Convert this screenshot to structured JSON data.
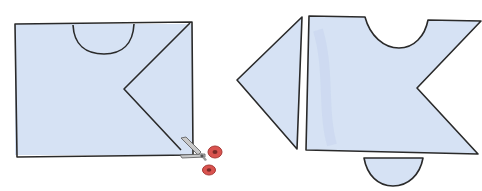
{
  "figure": {
    "description": "Paper cutting illustration: a folded rectangle with a semicircle and a V-notch marked, cut with scissors; resulting pieces shown separately",
    "colors": {
      "paper": "#d6e2f4",
      "paper_shade": "#c8d6ef",
      "outline": "#2a2a2a",
      "scissor_handle": "#d9534f",
      "scissor_handle_dark": "#a83a36",
      "scissor_blade": "#c9c9c9"
    },
    "steps": [
      {
        "id": "before-cut",
        "label": "Rectangle with semicircle and V marked, scissors cutting"
      },
      {
        "id": "after-cut",
        "label": "Pieces: triangle, notched main shape, half-disc"
      }
    ]
  }
}
